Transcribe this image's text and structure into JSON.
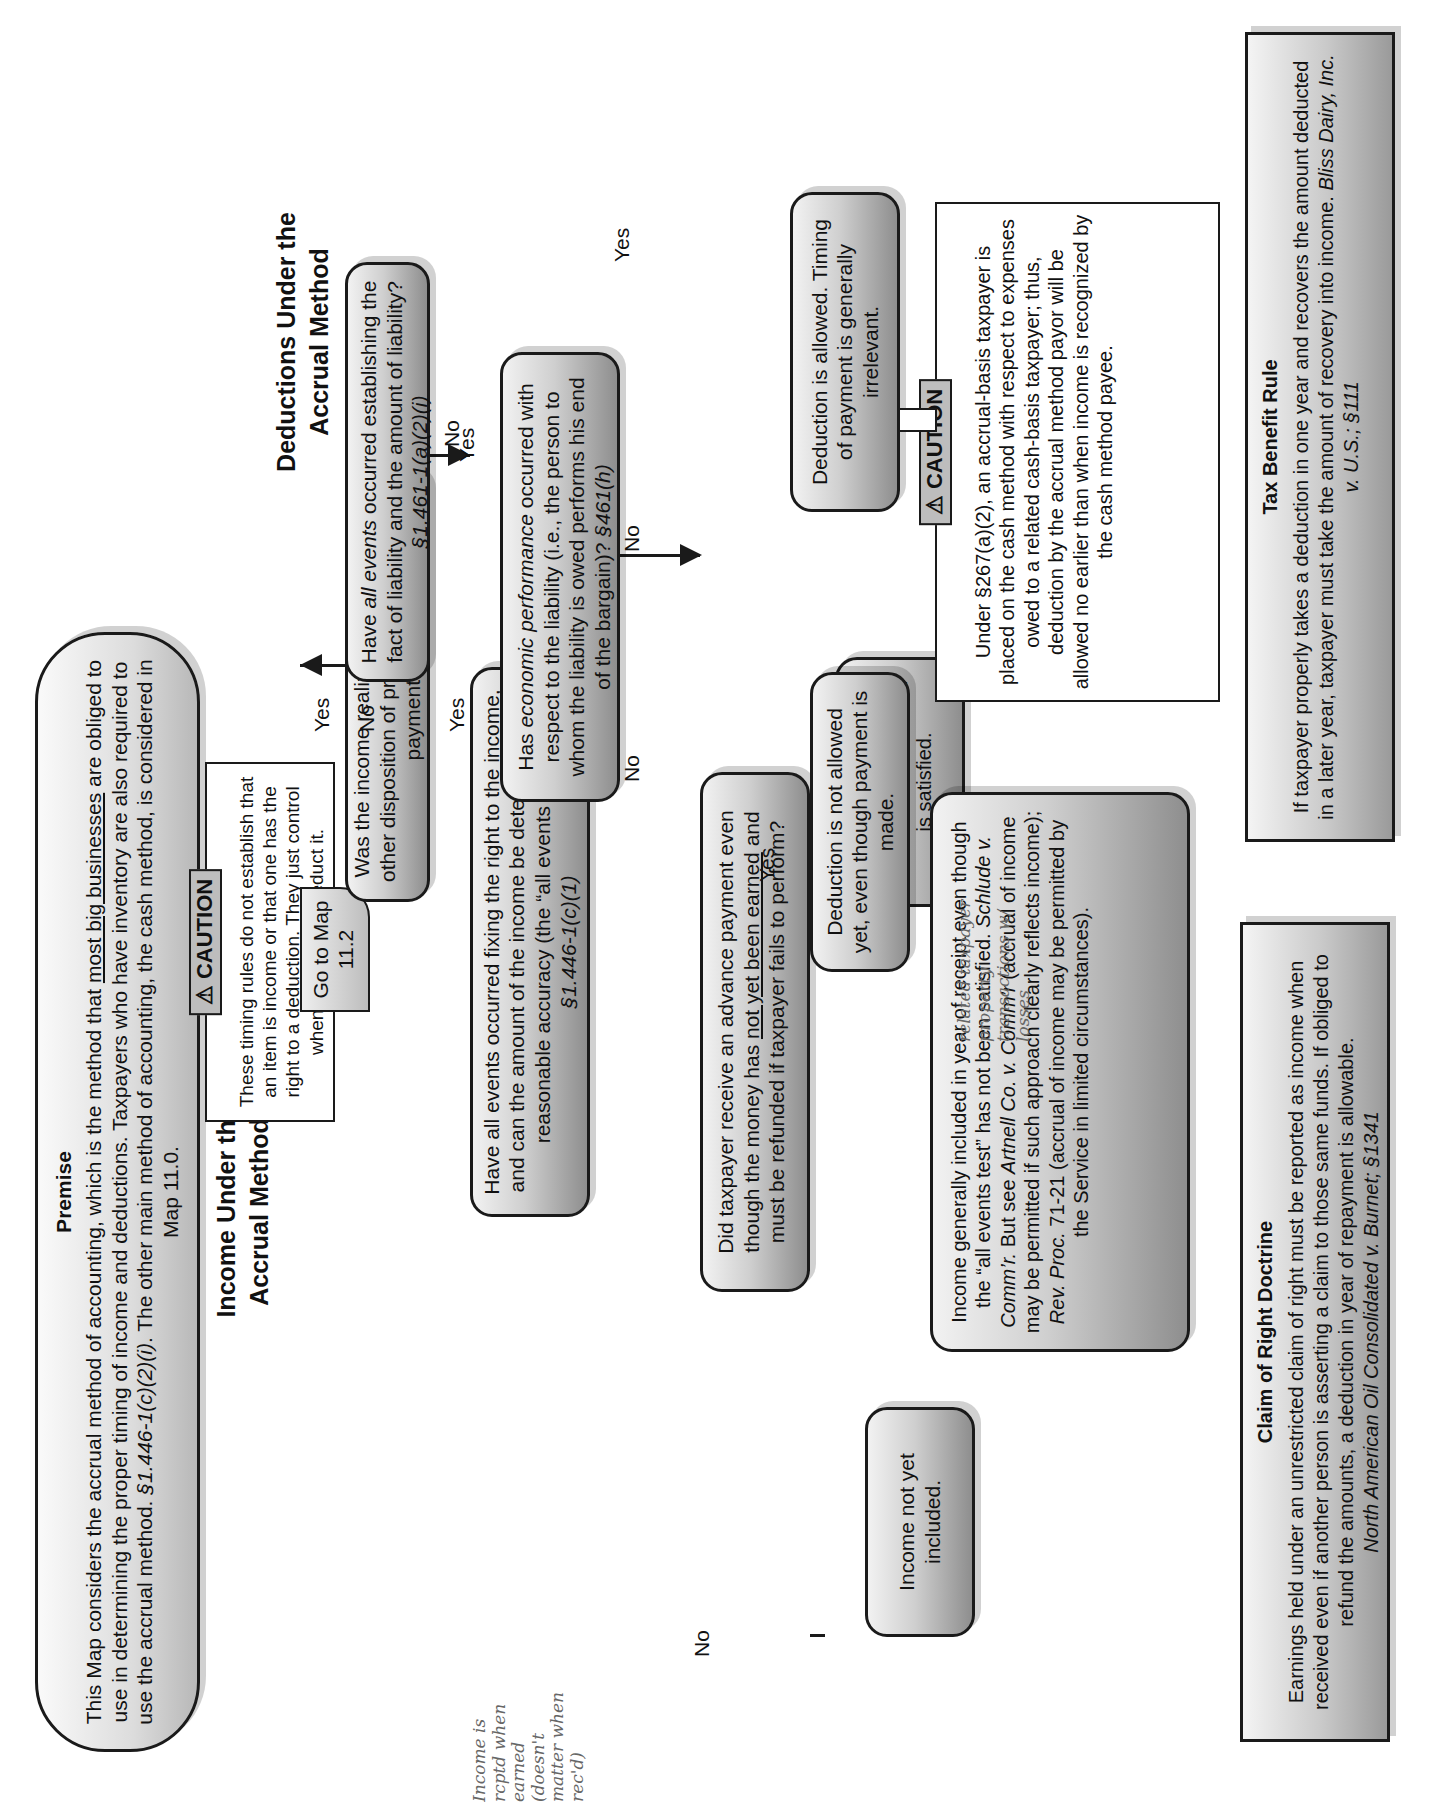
{
  "premise": {
    "title": "Premise",
    "line1_a": "This Map considers the accrual method of accounting, which is the method that ",
    "line1_u": "most big businesses",
    "line1_b": " are obliged to use in",
    "line2": "determining the proper timing of income and deductions.  Taxpayers who have inventory are also required to use the accrual",
    "line3_a": "method.  ",
    "line3_cite": "§1.446-1(c)(2)(i)",
    "line3_b": ".  The other main method of accounting, the cash method, is considered in Map 11.0."
  },
  "caution_timing": {
    "tag": "⚠ CAUTION",
    "text": "These timing rules do not establish that an item is income or that one has the right to a deduction.  They just control when to report or deduct it."
  },
  "income": {
    "heading": "Income Under the Accrual Method",
    "q1": "Was the income realized from the sale or other disposition of property on a deferred payment basis?",
    "q1_yes": "Yes",
    "q1_no": "No",
    "goto": "Go to Map 11.2",
    "q2_text": "Have all events occurred fixing the right to the income, and can the amount of the income be determined with reasonable accuracy (the “all events test”)?",
    "q2_cite": "§1.446-1(c)(1)",
    "q2_yes": "Yes",
    "q2_no": "No",
    "r_included": "Income included in year in which “all events test” is satisfied.",
    "q3_a": "Did taxpayer receive an advance payment even though the money has ",
    "q3_u": "not yet been earned",
    "q3_b": " and must be refunded if taxpayer fails to perform?",
    "q3_yes": "Yes",
    "q3_no": "No",
    "r_not_included": "Income not yet included.",
    "r_receipt_1": "Income generally included in year of receipt even though the “all events test” has not been satisfied.  ",
    "r_receipt_c1": "Schlude v. Comm’r.",
    "r_receipt_2": "  But see ",
    "r_receipt_c2": "Artnell Co. v. Comm’r",
    "r_receipt_3": " (accrual of income may be permitted if such approach clearly reflects income); ",
    "r_receipt_c3": "Rev. Proc.",
    "r_receipt_4": " 71-21 (accrual of income may be permitted by the Service in limited circumstances)."
  },
  "deductions": {
    "heading": "Deductions Under the Accrual Method",
    "q1_a": "Have ",
    "q1_i": "all events",
    "q1_b": " occurred establishing the fact of liability and the amount of liability?  ",
    "q1_cite": "§1.461-1(a)(2)(i)",
    "q1_yes": "Yes",
    "q1_no": "No",
    "q2_a": "Has ",
    "q2_i": "economic performance",
    "q2_b": " occurred with respect to the liability (i.e., the person to whom the liability is owed performs his end of the bargain)?  ",
    "q2_cite": "§461(h)",
    "q2_yes": "Yes",
    "q2_no": "No",
    "r_allowed": "Deduction is allowed.  Timing of payment is generally irrelevant.",
    "r_not_allowed": "Deduction is not allowed yet, even though payment is made."
  },
  "caution_267": {
    "tag": "⚠ CAUTION",
    "text": "Under §267(a)(2), an accrual-basis taxpayer is placed on the cash method with respect to expenses owed to a related cash-basis taxpayer; thus, deduction by the accrual method payor will be allowed no earlier than when income is recognized by the cash method payee."
  },
  "claim_of_right": {
    "title": "Claim of Right Doctrine",
    "text": "Earnings held under an unrestricted claim of right must be reported as income when received even if another person is asserting a claim to those same funds. If obliged to refund the amounts, a deduction in year of repayment is allowable.",
    "cite": "North American Oil Consolidated v. Burnet; §1341"
  },
  "tax_benefit": {
    "title": "Tax Benefit Rule",
    "text": "If taxpayer properly takes a deduction in one year and recovers the amount deducted in a later  year, taxpayer must take the amount of recovery into income.  ",
    "cite": "Bliss Dairy, Inc. v. U.S.; §111"
  },
  "handwritten": {
    "note_income": "Income is rcptd when earned (doesn't matter when rec'd)",
    "note_related": "related taxpayer property transactions w/ losses"
  }
}
